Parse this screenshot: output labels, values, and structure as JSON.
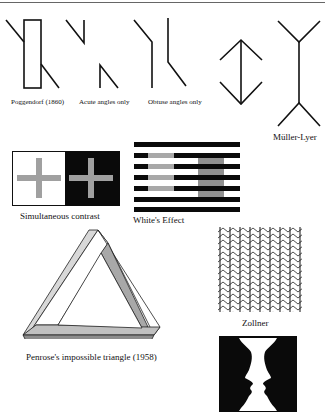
{
  "figure": {
    "illusions": [
      {
        "id": "poggendorf",
        "caption": "Poggendorf (1860)"
      },
      {
        "id": "acute",
        "caption": "Acute angles only"
      },
      {
        "id": "obtuse",
        "caption": "Obtuse angles only"
      },
      {
        "id": "arrows",
        "caption": ""
      },
      {
        "id": "muller-lyer",
        "caption": "Müller-Lyer"
      },
      {
        "id": "simultaneous-contrast",
        "caption": "Simultaneous contrast"
      },
      {
        "id": "whites-effect",
        "caption": "White's Effect"
      },
      {
        "id": "zollner",
        "caption": "Zollner"
      },
      {
        "id": "penrose",
        "caption": "Penrose's impossible triangle (1958)"
      },
      {
        "id": "rubin-vase",
        "caption": ""
      }
    ],
    "colors": {
      "ink": "#111111",
      "gray": "#a0a0a0",
      "penrose_light": "#d8d8d8",
      "penrose_mid": "#b0b0b0",
      "penrose_dark": "#8c8c8c"
    }
  }
}
